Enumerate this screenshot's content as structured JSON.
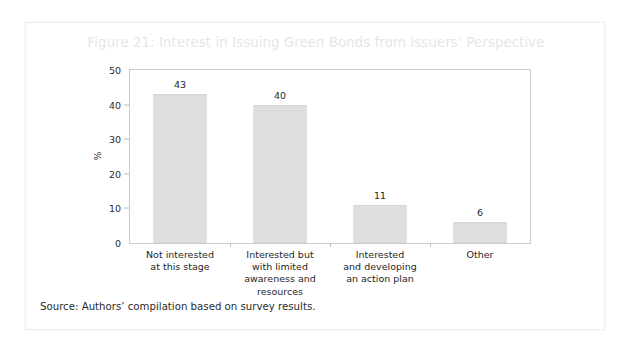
{
  "figure": {
    "title": "Figure 21: Interest in Issuing Green Bonds from Issuers’ Perspective",
    "source": "Source: Authors’ compilation based on survey results.",
    "title_color": "#e6e6e6",
    "bar_color": "#dedede",
    "axis_color": "#cccccc",
    "text_color": "#1f1f1f",
    "card_border_color": "#f0f0f0",
    "background_color": "#ffffff"
  },
  "chart_data": {
    "type": "bar",
    "title": "Figure 21: Interest in Issuing Green Bonds from Issuers’ Perspective",
    "categories": [
      "Not interested at this stage",
      "Interested but with limited awareness and resources",
      "Interested and developing an action plan",
      "Other"
    ],
    "category_lines": [
      [
        "Not interested",
        "at this stage"
      ],
      [
        "Interested but",
        "with limited",
        "awareness and",
        "resources"
      ],
      [
        "Interested",
        "and developing",
        "an action plan"
      ],
      [
        "Other"
      ]
    ],
    "values": [
      43,
      40,
      11,
      6
    ],
    "value_labels": [
      "43",
      "40",
      "11",
      "6"
    ],
    "xlabel": "",
    "ylabel": "%",
    "ylim": [
      0,
      50
    ],
    "yticks": [
      0,
      10,
      20,
      30,
      40,
      50
    ],
    "ytick_labels": [
      "0",
      "10",
      "20",
      "30",
      "40",
      "50"
    ],
    "grid": false,
    "legend": false
  }
}
